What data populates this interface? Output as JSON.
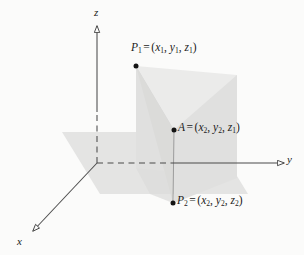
{
  "figure": {
    "background_color": "#fbfbfa",
    "line_color": "#444444",
    "point_color": "#111111",
    "axes": [
      {
        "id": "z",
        "label": "z",
        "direction": "up",
        "arrow": "open-triangle"
      },
      {
        "id": "y",
        "label": "y",
        "direction": "right",
        "arrow": "open-triangle"
      },
      {
        "id": "x",
        "label": "x",
        "direction": "down-left",
        "arrow": "open-triangle"
      }
    ],
    "points": [
      {
        "id": "p1",
        "name": "P",
        "name_sub": "1",
        "equals": "=",
        "coords": [
          {
            "var": "x",
            "sub": "1"
          },
          {
            "var": "y",
            "sub": "1"
          },
          {
            "var": "z",
            "sub": "1"
          }
        ],
        "dot_at": {
          "x": 136,
          "y": 66
        }
      },
      {
        "id": "a",
        "name": "A",
        "name_sub": "",
        "equals": "=",
        "coords": [
          {
            "var": "x",
            "sub": "2"
          },
          {
            "var": "y",
            "sub": "2"
          },
          {
            "var": "z",
            "sub": "1"
          }
        ],
        "dot_at": {
          "x": 174,
          "y": 130
        }
      },
      {
        "id": "p2",
        "name": "P",
        "name_sub": "2",
        "equals": "=",
        "coords": [
          {
            "var": "x",
            "sub": "2"
          },
          {
            "var": "y",
            "sub": "2"
          },
          {
            "var": "z",
            "sub": "2"
          }
        ],
        "dot_at": {
          "x": 173,
          "y": 203
        }
      }
    ],
    "planes": [
      {
        "id": "horizontal-plane",
        "fill": "#e3e3e3"
      },
      {
        "id": "vertical-plane",
        "fill": "#e8e8e8"
      },
      {
        "id": "triangle-p1-a-p2",
        "fill": "#d2d2d2"
      }
    ]
  }
}
